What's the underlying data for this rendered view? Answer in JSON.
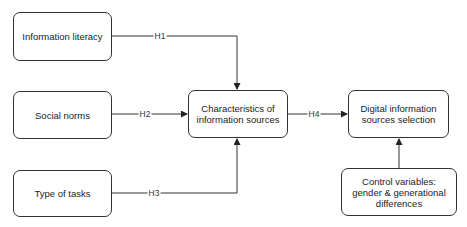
{
  "nodes": {
    "information_literacy": "Information literacy",
    "social_norms": "Social norms",
    "type_of_tasks": "Type of tasks",
    "characteristics": "Characteristics of information sources",
    "selection": "Digital information sources selection",
    "control": "Control variables: gender & generational differences"
  },
  "edges": {
    "h1": "H1",
    "h2": "H2",
    "h3": "H3",
    "h4": "H4"
  },
  "colors": {
    "stroke": "#333333",
    "background": "#ffffff"
  }
}
